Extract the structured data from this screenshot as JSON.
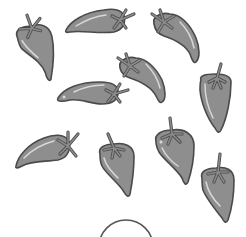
{
  "image": {
    "description": "Worksheet illustration of grey chili peppers scattered on white background",
    "background": "#ffffff"
  },
  "colors": {
    "pepper_fill": "#8e8e8e",
    "pepper_outline": "#4a4a4a",
    "pepper_highlight": "#d8d8d8",
    "stem_fill": "#8a8a8a",
    "arc_stroke": "#555555"
  },
  "pepper_count": "10",
  "peppers": [
    {
      "id": 1,
      "label": "pepper",
      "x": 14,
      "y": 12,
      "w": 44,
      "h": 72,
      "rotate": -15,
      "orientation": "vertical"
    },
    {
      "id": 2,
      "label": "pepper",
      "x": 64,
      "y": 6,
      "w": 72,
      "h": 30,
      "rotate": 0,
      "orientation": "horizontal"
    },
    {
      "id": 3,
      "label": "pepper",
      "x": 150,
      "y": 8,
      "w": 40,
      "h": 55,
      "rotate": -30,
      "orientation": "vertical"
    },
    {
      "id": 4,
      "label": "pepper",
      "x": 116,
      "y": 50,
      "w": 50,
      "h": 55,
      "rotate": -30,
      "orientation": "vertical"
    },
    {
      "id": 5,
      "label": "pepper",
      "x": 56,
      "y": 78,
      "w": 74,
      "h": 30,
      "rotate": 0,
      "orientation": "horizontal"
    },
    {
      "id": 6,
      "label": "pepper",
      "x": 197,
      "y": 62,
      "w": 36,
      "h": 70,
      "rotate": 0,
      "orientation": "vertical"
    },
    {
      "id": 7,
      "label": "pepper",
      "x": 14,
      "y": 130,
      "w": 64,
      "h": 40,
      "rotate": 0,
      "orientation": "horizontal"
    },
    {
      "id": 8,
      "label": "pepper",
      "x": 96,
      "y": 132,
      "w": 40,
      "h": 64,
      "rotate": -10,
      "orientation": "vertical"
    },
    {
      "id": 9,
      "label": "pepper",
      "x": 152,
      "y": 116,
      "w": 44,
      "h": 70,
      "rotate": -10,
      "orientation": "vertical"
    },
    {
      "id": 10,
      "label": "pepper",
      "x": 198,
      "y": 152,
      "w": 38,
      "h": 72,
      "rotate": -5,
      "orientation": "vertical"
    }
  ],
  "answer_circle": {
    "cx": 126,
    "cy": 246,
    "r": 27
  }
}
